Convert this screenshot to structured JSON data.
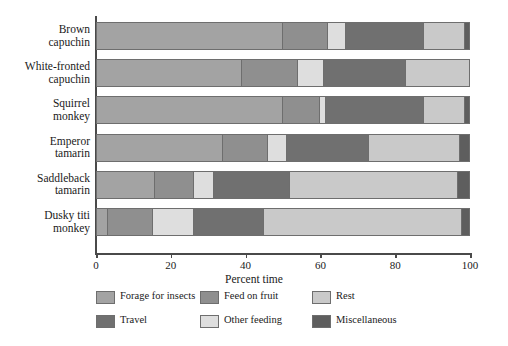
{
  "chart_data": {
    "type": "bar",
    "orientation": "horizontal",
    "stacked": true,
    "title": "",
    "xlabel": "Percent time",
    "ylabel": "",
    "xlim": [
      0,
      100
    ],
    "xticks": [
      0,
      20,
      40,
      60,
      80,
      100
    ],
    "grid": false,
    "legend_position": "below",
    "categories": [
      "Brown capuchin",
      "White-fronted capuchin",
      "Squirrel monkey",
      "Emperor tamarin",
      "Saddleback tamarin",
      "Dusky titi monkey"
    ],
    "series": [
      {
        "name": "Forage for insects",
        "color": "#a3a3a3",
        "values": [
          50,
          39,
          50,
          34,
          15.5,
          3
        ]
      },
      {
        "name": "Feed on fruit",
        "color": "#8f8f8f",
        "values": [
          12,
          15,
          10,
          12,
          10.5,
          12
        ]
      },
      {
        "name": "Rest",
        "color": "#c9c9c9",
        "values": [
          0,
          0,
          1.5,
          0,
          0,
          0
        ]
      },
      {
        "name": "Other feeding",
        "color": "#dedede",
        "values": [
          5,
          7,
          0,
          5,
          5.5,
          11
        ]
      },
      {
        "name": "Travel",
        "color": "#707070",
        "values": [
          21,
          22,
          26.5,
          22,
          20.5,
          19
        ]
      },
      {
        "name": "Rest2",
        "color": "#c9c9c9",
        "values": [
          11,
          17,
          11,
          24.5,
          45,
          53
        ]
      },
      {
        "name": "Miscellaneous",
        "color": "#5e5e5e",
        "values": [
          1,
          0,
          0.5,
          2.5,
          3,
          2
        ]
      }
    ],
    "bars": [
      {
        "category": "Brown capuchin",
        "segments": [
          {
            "label": "Forage for insects",
            "value": 50,
            "color": "#a3a3a3"
          },
          {
            "label": "Feed on fruit",
            "value": 12,
            "color": "#8f8f8f"
          },
          {
            "label": "Other feeding",
            "value": 5,
            "color": "#dedede"
          },
          {
            "label": "Travel",
            "value": 21,
            "color": "#707070"
          },
          {
            "label": "Rest",
            "value": 11,
            "color": "#c9c9c9"
          },
          {
            "label": "Miscellaneous",
            "value": 1,
            "color": "#5e5e5e"
          }
        ]
      },
      {
        "category": "White-fronted capuchin",
        "segments": [
          {
            "label": "Forage for insects",
            "value": 39,
            "color": "#a3a3a3"
          },
          {
            "label": "Feed on fruit",
            "value": 15,
            "color": "#8f8f8f"
          },
          {
            "label": "Other feeding",
            "value": 7,
            "color": "#dedede"
          },
          {
            "label": "Travel",
            "value": 22,
            "color": "#707070"
          },
          {
            "label": "Rest",
            "value": 17,
            "color": "#c9c9c9"
          }
        ]
      },
      {
        "category": "Squirrel monkey",
        "segments": [
          {
            "label": "Forage for insects",
            "value": 50,
            "color": "#a3a3a3"
          },
          {
            "label": "Feed on fruit",
            "value": 10,
            "color": "#8f8f8f"
          },
          {
            "label": "Other feeding",
            "value": 1.5,
            "color": "#dedede"
          },
          {
            "label": "Travel",
            "value": 26.5,
            "color": "#707070"
          },
          {
            "label": "Rest",
            "value": 11,
            "color": "#c9c9c9"
          },
          {
            "label": "Miscellaneous",
            "value": 1,
            "color": "#5e5e5e"
          }
        ]
      },
      {
        "category": "Emperor tamarin",
        "segments": [
          {
            "label": "Forage for insects",
            "value": 34,
            "color": "#a3a3a3"
          },
          {
            "label": "Feed on fruit",
            "value": 12,
            "color": "#8f8f8f"
          },
          {
            "label": "Other feeding",
            "value": 5,
            "color": "#dedede"
          },
          {
            "label": "Travel",
            "value": 22,
            "color": "#707070"
          },
          {
            "label": "Rest",
            "value": 24.5,
            "color": "#c9c9c9"
          },
          {
            "label": "Miscellaneous",
            "value": 2.5,
            "color": "#5e5e5e"
          }
        ]
      },
      {
        "category": "Saddleback tamarin",
        "segments": [
          {
            "label": "Forage for insects",
            "value": 15.5,
            "color": "#a3a3a3"
          },
          {
            "label": "Feed on fruit",
            "value": 10.5,
            "color": "#8f8f8f"
          },
          {
            "label": "Other feeding",
            "value": 5.5,
            "color": "#dedede"
          },
          {
            "label": "Travel",
            "value": 20.5,
            "color": "#707070"
          },
          {
            "label": "Rest",
            "value": 45,
            "color": "#c9c9c9"
          },
          {
            "label": "Miscellaneous",
            "value": 3,
            "color": "#5e5e5e"
          }
        ]
      },
      {
        "category": "Dusky titi monkey",
        "segments": [
          {
            "label": "Forage for insects",
            "value": 3,
            "color": "#a3a3a3"
          },
          {
            "label": "Feed on fruit",
            "value": 12,
            "color": "#8f8f8f"
          },
          {
            "label": "Other feeding",
            "value": 11,
            "color": "#dedede"
          },
          {
            "label": "Travel",
            "value": 19,
            "color": "#707070"
          },
          {
            "label": "Rest",
            "value": 53,
            "color": "#c9c9c9"
          },
          {
            "label": "Miscellaneous",
            "value": 2,
            "color": "#5e5e5e"
          }
        ]
      }
    ],
    "legend": [
      {
        "label": "Forage for insects",
        "color": "#a3a3a3"
      },
      {
        "label": "Feed on fruit",
        "color": "#8f8f8f"
      },
      {
        "label": "Rest",
        "color": "#c9c9c9"
      },
      {
        "label": "Travel",
        "color": "#707070"
      },
      {
        "label": "Other feeding",
        "color": "#dedede"
      },
      {
        "label": "Miscellaneous",
        "color": "#5e5e5e"
      }
    ]
  }
}
